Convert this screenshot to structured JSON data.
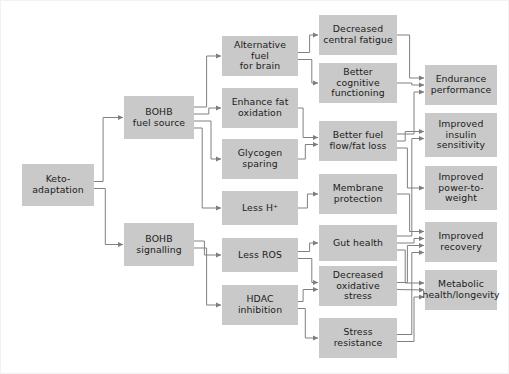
{
  "diagram": {
    "background_color": "#ffffff",
    "node_fill_color": "#c9c9c9",
    "node_text_color": "#1b1b1b",
    "edge_color": "#808080",
    "columns": [
      {
        "name": "trigger",
        "label": "Keto-adaptation"
      },
      {
        "name": "mechanism",
        "label": "BOHB pathways"
      },
      {
        "name": "process",
        "label": "Metabolic processes"
      },
      {
        "name": "effect",
        "label": "Physiological effects"
      },
      {
        "name": "outcome",
        "label": "Outcomes"
      }
    ],
    "nodes": [
      {
        "id": "keto-adaptation",
        "label": "Keto-\nadaptation",
        "column": "trigger",
        "x": 22,
        "y": 164,
        "w": 72,
        "h": 42
      },
      {
        "id": "bohb-fuel-source",
        "label": "BOHB\nfuel source",
        "column": "mechanism",
        "x": 124,
        "y": 96,
        "w": 70,
        "h": 43
      },
      {
        "id": "bohb-signalling",
        "label": "BOHB\nsignalling",
        "column": "mechanism",
        "x": 124,
        "y": 223,
        "w": 70,
        "h": 43
      },
      {
        "id": "alternative-fuel-for-brain",
        "label": "Alternative fuel\nfor brain",
        "column": "process",
        "x": 222,
        "y": 36,
        "w": 76,
        "h": 40
      },
      {
        "id": "enhance-fat-oxidation",
        "label": "Enhance fat\noxidation",
        "column": "process",
        "x": 222,
        "y": 88,
        "w": 76,
        "h": 40
      },
      {
        "id": "glycogen-sparing",
        "label": "Glycogen\nsparing",
        "column": "process",
        "x": 222,
        "y": 139,
        "w": 76,
        "h": 40
      },
      {
        "id": "less-h-plus",
        "label": "Less H⁺",
        "column": "process",
        "x": 222,
        "y": 191,
        "w": 76,
        "h": 34
      },
      {
        "id": "less-ros",
        "label": "Less ROS",
        "column": "process",
        "x": 222,
        "y": 238,
        "w": 76,
        "h": 34
      },
      {
        "id": "hdac-inhibition",
        "label": "HDAC\ninhibition",
        "column": "process",
        "x": 222,
        "y": 285,
        "w": 76,
        "h": 40
      },
      {
        "id": "decreased-central-fatigue",
        "label": "Decreased\ncentral fatigue",
        "column": "effect",
        "x": 319,
        "y": 15,
        "w": 78,
        "h": 40
      },
      {
        "id": "better-cognitive-functioning",
        "label": "Better cognitive\nfunctioning",
        "column": "effect",
        "x": 319,
        "y": 63,
        "w": 78,
        "h": 40
      },
      {
        "id": "better-fuel-flow-fat-loss",
        "label": "Better fuel\nflow/fat loss",
        "column": "effect",
        "x": 319,
        "y": 121,
        "w": 78,
        "h": 40
      },
      {
        "id": "membrane-protection",
        "label": "Membrane\nprotection",
        "column": "effect",
        "x": 319,
        "y": 174,
        "w": 78,
        "h": 40
      },
      {
        "id": "gut-health",
        "label": "Gut health",
        "column": "effect",
        "x": 319,
        "y": 225,
        "w": 78,
        "h": 36
      },
      {
        "id": "decreased-oxidative-stress",
        "label": "Decreased\noxidative stress",
        "column": "effect",
        "x": 319,
        "y": 266,
        "w": 78,
        "h": 40
      },
      {
        "id": "stress-resistance",
        "label": "Stress\nresistance",
        "column": "effect",
        "x": 319,
        "y": 318,
        "w": 78,
        "h": 40
      },
      {
        "id": "endurance-performance",
        "label": "Endurance\nperformance",
        "column": "outcome",
        "x": 425,
        "y": 65,
        "w": 72,
        "h": 40
      },
      {
        "id": "improved-insulin-sensitivity",
        "label": "Improved\ninsulin\nsensitivity",
        "column": "outcome",
        "x": 425,
        "y": 113,
        "w": 72,
        "h": 44
      },
      {
        "id": "improved-power-to-weight",
        "label": "Improved\npower-to-\nweight",
        "column": "outcome",
        "x": 425,
        "y": 166,
        "w": 72,
        "h": 44
      },
      {
        "id": "improved-recovery",
        "label": "Improved\nrecovery",
        "column": "outcome",
        "x": 425,
        "y": 222,
        "w": 72,
        "h": 40
      },
      {
        "id": "metabolic-health-longevity",
        "label": "Metabolic\nhealth/longevity",
        "column": "outcome",
        "x": 425,
        "y": 270,
        "w": 72,
        "h": 40
      }
    ],
    "edges": [
      {
        "from": "keto-adaptation",
        "to": "bohb-fuel-source"
      },
      {
        "from": "keto-adaptation",
        "to": "bohb-signalling"
      },
      {
        "from": "bohb-fuel-source",
        "to": "alternative-fuel-for-brain"
      },
      {
        "from": "bohb-fuel-source",
        "to": "enhance-fat-oxidation"
      },
      {
        "from": "bohb-fuel-source",
        "to": "glycogen-sparing"
      },
      {
        "from": "bohb-fuel-source",
        "to": "less-h-plus"
      },
      {
        "from": "bohb-signalling",
        "to": "less-ros"
      },
      {
        "from": "bohb-signalling",
        "to": "hdac-inhibition"
      },
      {
        "from": "alternative-fuel-for-brain",
        "to": "decreased-central-fatigue"
      },
      {
        "from": "alternative-fuel-for-brain",
        "to": "better-cognitive-functioning"
      },
      {
        "from": "enhance-fat-oxidation",
        "to": "better-fuel-flow-fat-loss"
      },
      {
        "from": "glycogen-sparing",
        "to": "better-fuel-flow-fat-loss"
      },
      {
        "from": "less-h-plus",
        "to": "membrane-protection"
      },
      {
        "from": "less-ros",
        "to": "gut-health"
      },
      {
        "from": "less-ros",
        "to": "decreased-oxidative-stress"
      },
      {
        "from": "hdac-inhibition",
        "to": "decreased-oxidative-stress"
      },
      {
        "from": "hdac-inhibition",
        "to": "stress-resistance"
      },
      {
        "from": "decreased-central-fatigue",
        "to": "endurance-performance"
      },
      {
        "from": "better-cognitive-functioning",
        "to": "endurance-performance"
      },
      {
        "from": "better-fuel-flow-fat-loss",
        "to": "endurance-performance"
      },
      {
        "from": "better-fuel-flow-fat-loss",
        "to": "improved-insulin-sensitivity"
      },
      {
        "from": "better-fuel-flow-fat-loss",
        "to": "improved-power-to-weight"
      },
      {
        "from": "membrane-protection",
        "to": "improved-recovery"
      },
      {
        "from": "gut-health",
        "to": "improved-insulin-sensitivity"
      },
      {
        "from": "gut-health",
        "to": "improved-recovery"
      },
      {
        "from": "gut-health",
        "to": "metabolic-health-longevity"
      },
      {
        "from": "decreased-oxidative-stress",
        "to": "improved-recovery"
      },
      {
        "from": "decreased-oxidative-stress",
        "to": "metabolic-health-longevity"
      },
      {
        "from": "stress-resistance",
        "to": "improved-recovery"
      },
      {
        "from": "stress-resistance",
        "to": "metabolic-health-longevity"
      }
    ]
  }
}
